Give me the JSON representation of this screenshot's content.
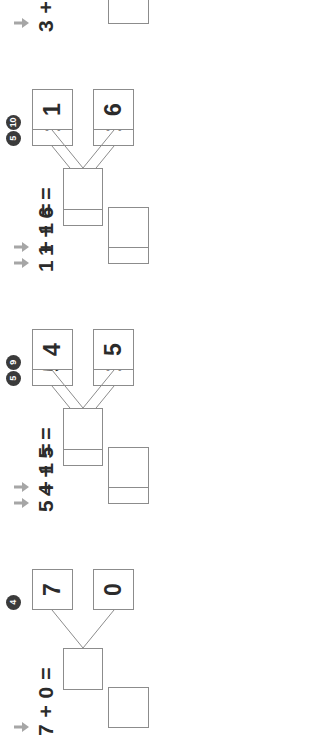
{
  "page": {
    "type": "math-worksheet",
    "topic": "addition-number-bonds",
    "orientation": "rotated-90",
    "background_color": "#ffffff",
    "box_border_color": "#8c8c8c",
    "text_color": "#2b2b2b",
    "badge_color": "#3b3b3b",
    "arrow_color": "#a6a6a6"
  },
  "problems": [
    {
      "number": "4",
      "addend_top": "7",
      "addend_bottom": "0",
      "sum": "",
      "equation": "7 + 0 =",
      "answer": "",
      "arrow_icon": "down-arrow-icon",
      "partially_visible": true
    },
    {
      "number": "5",
      "addend_top": "5",
      "addend_bottom": "1",
      "sum": "",
      "equation": "5 + 1 =",
      "answer": "",
      "arrow_icon": "down-arrow-icon",
      "partially_visible": false
    },
    {
      "number": "9",
      "addend_top": "4",
      "addend_bottom": "5",
      "sum": "",
      "equation": "4 + 5 =",
      "answer": "",
      "arrow_icon": "down-arrow-icon",
      "partially_visible": true
    },
    {
      "number": "5",
      "addend_top": "1",
      "addend_bottom": "1",
      "sum": "",
      "equation": "1 + 1 =",
      "answer": "",
      "arrow_icon": "down-arrow-icon",
      "partially_visible": false
    },
    {
      "number": "10",
      "addend_top": "1",
      "addend_bottom": "6",
      "sum": "",
      "equation": "1 + 6 =",
      "answer": "",
      "arrow_icon": "down-arrow-icon",
      "partially_visible": true
    },
    {
      "number": "6",
      "addend_top": "3",
      "addend_bottom": "3",
      "sum": "",
      "equation": "3 + 3 =",
      "answer": "",
      "arrow_icon": "down-arrow-icon",
      "partially_visible": false
    }
  ]
}
